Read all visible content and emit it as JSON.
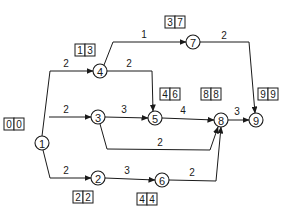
{
  "diagram": {
    "type": "activity-on-node network (critical path)",
    "nodes": [
      {
        "id": "1",
        "label": "1",
        "x": 42,
        "y": 143,
        "times": [
          "0",
          "0"
        ],
        "box": {
          "x": 4,
          "y": 118
        }
      },
      {
        "id": "2",
        "label": "2",
        "x": 98,
        "y": 178,
        "times": [
          "2",
          "2"
        ],
        "box": {
          "x": 73,
          "y": 191
        }
      },
      {
        "id": "3",
        "label": "3",
        "x": 98,
        "y": 117,
        "times": [],
        "box": null
      },
      {
        "id": "4",
        "label": "4",
        "x": 100,
        "y": 71,
        "times": [
          "1",
          "3"
        ],
        "box": {
          "x": 75,
          "y": 44
        }
      },
      {
        "id": "5",
        "label": "5",
        "x": 155,
        "y": 118,
        "times": [
          "4",
          "6"
        ],
        "box": {
          "x": 160,
          "y": 88
        }
      },
      {
        "id": "6",
        "label": "6",
        "x": 162,
        "y": 180,
        "times": [
          "4",
          "4"
        ],
        "box": {
          "x": 137,
          "y": 193
        }
      },
      {
        "id": "7",
        "label": "7",
        "x": 193,
        "y": 42,
        "times": [
          "3",
          "7"
        ],
        "box": {
          "x": 165,
          "y": 16
        }
      },
      {
        "id": "8",
        "label": "8",
        "x": 221,
        "y": 120,
        "times": [
          "8",
          "8"
        ],
        "box": {
          "x": 201,
          "y": 88
        }
      },
      {
        "id": "9",
        "label": "9",
        "x": 256,
        "y": 120,
        "times": [
          "9",
          "9"
        ],
        "box": {
          "x": 258,
          "y": 88
        }
      }
    ],
    "edges": [
      {
        "from": "1",
        "to": "4",
        "weight": "2",
        "label_pos": {
          "x": 66,
          "y": 67
        }
      },
      {
        "from": "1",
        "to": "3",
        "weight": "2",
        "label_pos": {
          "x": 66,
          "y": 111
        }
      },
      {
        "from": "1",
        "to": "2",
        "weight": "2",
        "label_pos": {
          "x": 66,
          "y": 172
        }
      },
      {
        "from": "4",
        "to": "7",
        "weight": "1",
        "label_pos": {
          "x": 144,
          "y": 38
        }
      },
      {
        "from": "4",
        "to": "5",
        "weight": "2",
        "label_pos": {
          "x": 129,
          "y": 67
        }
      },
      {
        "from": "7",
        "to": "9",
        "weight": "2",
        "label_pos": {
          "x": 224,
          "y": 39
        }
      },
      {
        "from": "3",
        "to": "5",
        "weight": "3",
        "label_pos": {
          "x": 124,
          "y": 113
        }
      },
      {
        "from": "3",
        "to": "8",
        "weight": "2",
        "label_pos": {
          "x": 160,
          "y": 146
        }
      },
      {
        "from": "5",
        "to": "8",
        "weight": "4",
        "label_pos": {
          "x": 183,
          "y": 114
        }
      },
      {
        "from": "8",
        "to": "9",
        "weight": "3",
        "label_pos": {
          "x": 237,
          "y": 114
        }
      },
      {
        "from": "2",
        "to": "6",
        "weight": "3",
        "label_pos": {
          "x": 127,
          "y": 174
        }
      },
      {
        "from": "6",
        "to": "8",
        "weight": "2",
        "label_pos": {
          "x": 192,
          "y": 176
        }
      }
    ]
  }
}
